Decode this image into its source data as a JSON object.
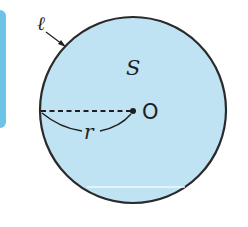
{
  "colors": {
    "circle_fill": "#bfe3f3",
    "circle_stroke": "#2a2a2a",
    "side_tab": "#6cc3e6",
    "highlight_line": "#eef8fc",
    "text": "#1f1f1f"
  },
  "diagram": {
    "circle_label": "ℓ",
    "area_label": "S",
    "radius_label": "r",
    "center_label": "O"
  }
}
